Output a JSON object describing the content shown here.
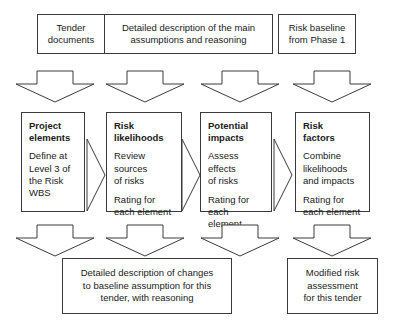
{
  "diagram": {
    "background_color": "#ffffff",
    "line_color": "#3a3a3a",
    "text_color": "#1a1a1a"
  },
  "top_row": {
    "boxes": [
      {
        "id": "tender-documents",
        "lines": [
          "Tender",
          "documents"
        ],
        "text": "Tender documents"
      },
      {
        "id": "detailed-description",
        "lines": [
          "Detailed description of the main",
          "assumptions and reasoning"
        ],
        "text": "Detailed description of the main assumptions and reasoning"
      },
      {
        "id": "risk-baseline",
        "lines": [
          "Risk baseline",
          "from Phase 1"
        ],
        "text": "Risk baseline from Phase 1"
      }
    ]
  },
  "down_arrows_top": [
    {
      "id": "down-arrow-1"
    },
    {
      "id": "down-arrow-2"
    },
    {
      "id": "down-arrow-3"
    },
    {
      "id": "down-arrow-4"
    }
  ],
  "stages": [
    {
      "id": "project-elements",
      "title": "Project elements",
      "title_lines": [
        "Project",
        "elements"
      ],
      "body_lines": [
        "Define at",
        "Level 3 of",
        "the Risk",
        "WBS"
      ],
      "body_text": "Define at Level 3 of the Risk WBS",
      "extra_lines": [],
      "extra_text": ""
    },
    {
      "id": "risk-likelihoods",
      "title": "Risk likelihoods",
      "title_lines": [
        "Risk",
        "likelihoods"
      ],
      "body_lines": [
        "Review",
        "sources",
        "of risks"
      ],
      "body_text": "Review sources of risks",
      "extra_lines": [
        "Rating for",
        "each element"
      ],
      "extra_text": "Rating for each element"
    },
    {
      "id": "potential-impacts",
      "title": "Potential impacts",
      "title_lines": [
        "Potential",
        "impacts"
      ],
      "body_lines": [
        "Assess",
        "effects",
        "of risks"
      ],
      "body_text": "Assess effects of risks",
      "extra_lines": [
        "Rating for",
        "each element"
      ],
      "extra_text": "Rating for each element"
    },
    {
      "id": "risk-factors",
      "title": "Risk factors",
      "title_lines": [
        "Risk",
        "factors"
      ],
      "body_lines": [
        "Combine",
        "likelihoods",
        "and impacts"
      ],
      "body_text": "Combine likelihoods and impacts",
      "extra_lines": [
        "Rating for",
        "each element"
      ],
      "extra_text": "Rating for each element"
    }
  ],
  "chevrons": [
    {
      "id": "chevron-1"
    },
    {
      "id": "chevron-2"
    },
    {
      "id": "chevron-3"
    }
  ],
  "down_arrows_bottom": [
    {
      "id": "down-arrow-5"
    },
    {
      "id": "down-arrow-6"
    },
    {
      "id": "down-arrow-7"
    },
    {
      "id": "down-arrow-8"
    }
  ],
  "bottom_row": {
    "boxes": [
      {
        "id": "changes-to-baseline",
        "lines": [
          "Detailed description of changes",
          "to baseline assumption for this",
          "tender, with reasoning"
        ],
        "text": "Detailed description of changes to baseline assumption for this tender, with reasoning"
      },
      {
        "id": "modified-risk-assessment",
        "lines": [
          "Modified risk",
          "assessment",
          "for this tender"
        ],
        "text": "Modified risk assessment for this tender"
      }
    ]
  }
}
